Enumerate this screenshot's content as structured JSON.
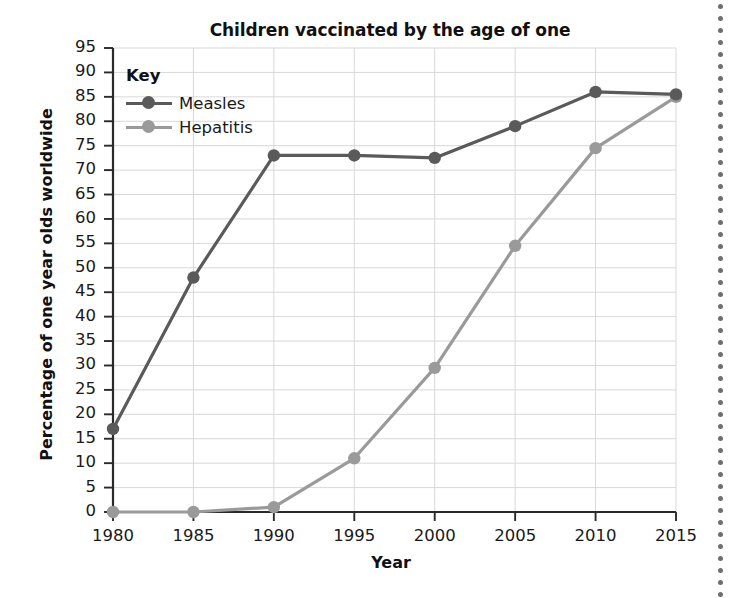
{
  "chart_data": {
    "type": "line",
    "title": "Children vaccinated by the age of one",
    "xlabel": "Year",
    "ylabel": "Percentage of one year olds worldwide",
    "x": [
      1980,
      1985,
      1990,
      1995,
      2000,
      2005,
      2010,
      2015
    ],
    "xtick_labels": [
      "1980",
      "1985",
      "1990",
      "1995",
      "2000",
      "2005",
      "2010",
      "2015"
    ],
    "ytick_labels": [
      "0",
      "5",
      "10",
      "15",
      "20",
      "25",
      "30",
      "35",
      "40",
      "45",
      "50",
      "55",
      "60",
      "65",
      "70",
      "75",
      "80",
      "85",
      "90",
      "95"
    ],
    "ytick_values": [
      0,
      5,
      10,
      15,
      20,
      25,
      30,
      35,
      40,
      45,
      50,
      55,
      60,
      65,
      70,
      75,
      80,
      85,
      90,
      95
    ],
    "xlim": [
      1980,
      2015
    ],
    "ylim": [
      0,
      95
    ],
    "grid": true,
    "legend_position": "top-left",
    "legend_title": "Key",
    "series": [
      {
        "name": "Measles",
        "color": "#5a5a5a",
        "values": [
          17,
          48,
          73,
          73,
          72.5,
          79,
          86,
          85.5
        ]
      },
      {
        "name": "Hepatitis",
        "color": "#9a9a9a",
        "values": [
          0,
          0,
          1,
          11,
          29.5,
          54.5,
          74.5,
          85
        ]
      }
    ]
  },
  "decoration": {
    "right_margin_rule": "dotted-vertical-line"
  }
}
